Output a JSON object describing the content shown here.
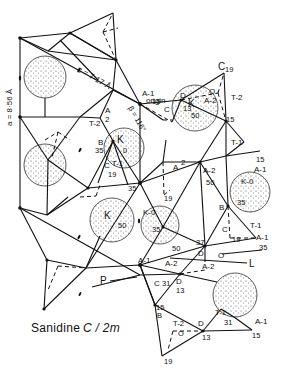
{
  "figure": {
    "caption_mineral": "Sanidine",
    "caption_spacegroup": "C / 2m",
    "axis_c": "c = 7·17 Å",
    "axis_a": "a = 8·56 Å",
    "angle_beta": "β = 116°",
    "origin_label": "A-1",
    "origin_word": "origin"
  },
  "atoms": [
    {
      "label": "K",
      "height": "50"
    },
    {
      "label": "K",
      "height": "0"
    },
    {
      "label": "K",
      "height": "50"
    },
    {
      "label": "K-0",
      "height": "35"
    },
    {
      "label": "K-0",
      "height": "35"
    }
  ],
  "labels": {
    "c19": "C",
    "c19_h": "19",
    "d_top": "D",
    "d_top_h": "13",
    "o_top": "O",
    "a2_top": "A-2",
    "t2_top": "T-2",
    "h15_top": "15",
    "a1_origin_h": "15",
    "c_origin": "C",
    "a2_left": "A",
    "a2_left_b": "2",
    "t2_left": "T-2",
    "b_left": "B",
    "b_left_h": "35",
    "c_left": "C",
    "t1_left": "T-1",
    "c_left_h": "19",
    "h35_left": "35",
    "t1_right": "T-1",
    "h15_right": "15",
    "a1_right": "A-1",
    "a_mid": "A",
    "a_mid_2": "2",
    "a2_mid": "A-2",
    "h50_mid": "50",
    "b_right": "B",
    "b_right_h": "35",
    "c_right": "C",
    "c_right_h": "19",
    "t1_right2": "T-1",
    "a1_right2": "A-1",
    "h35_right2": "35",
    "h19_mid": "19",
    "h50_low": "50",
    "h37": "37",
    "d_mid": "D",
    "o_mid": "O",
    "a2_low": "A-2",
    "l_line": "L",
    "a1_low": "A-1",
    "a2_low2": "A-2",
    "d_low": "D",
    "p_line": "P",
    "c_low": "C",
    "h31_low": "31",
    "h13_low": "13",
    "h15_low": "15",
    "b_bot": "B",
    "t2_bot": "T-2",
    "o_bot": "O",
    "d_bot": "D",
    "h13_bot": "13",
    "h19_bot": "19",
    "t1_bot": "T-1",
    "h31_bot": "31",
    "a1_bot": "A-1",
    "h15_bot": "15"
  }
}
